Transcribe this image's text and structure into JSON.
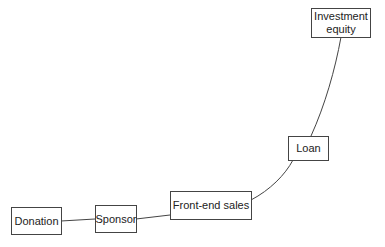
{
  "diagram": {
    "type": "progression-curve",
    "nodes": [
      {
        "id": "donation",
        "label": "Donation"
      },
      {
        "id": "sponsor",
        "label": "Sponsor"
      },
      {
        "id": "frontend",
        "label": "Front-end sales"
      },
      {
        "id": "loan",
        "label": "Loan"
      },
      {
        "id": "investment",
        "label": "Investment equity"
      }
    ],
    "edges": [
      [
        "donation",
        "sponsor"
      ],
      [
        "sponsor",
        "frontend"
      ],
      [
        "frontend",
        "loan"
      ],
      [
        "loan",
        "investment"
      ]
    ],
    "colors": {
      "line": "#444444",
      "border": "#444444",
      "text": "#222222"
    }
  }
}
